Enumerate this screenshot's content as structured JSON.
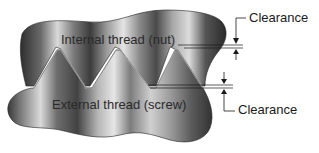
{
  "diagram": {
    "labels": {
      "internal_thread": "Internal thread (nut)",
      "external_thread": "External thread (screw)",
      "clearance_top": "Clearance",
      "clearance_bottom": "Clearance"
    },
    "colors": {
      "metal_dark": "#3a3a3a",
      "metal_light": "#d8d8d8",
      "line": "#1a1a1a",
      "background": "#ffffff"
    }
  }
}
